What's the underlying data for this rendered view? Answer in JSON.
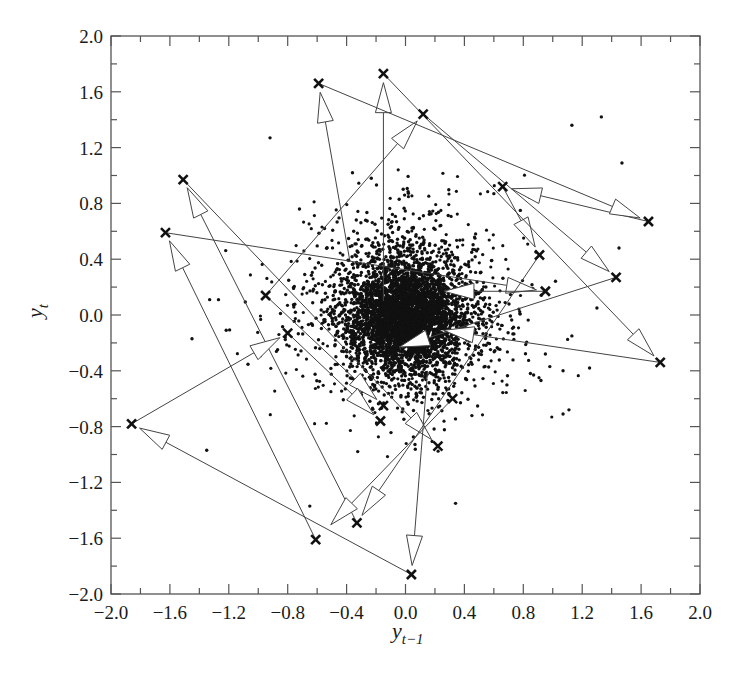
{
  "chart_data": {
    "type": "scatter",
    "title": "",
    "xlabel": "y_{t-1}",
    "ylabel": "y_t",
    "xlabel_parts": {
      "base": "y",
      "sub": "t−1"
    },
    "ylabel_parts": {
      "base": "y",
      "sub": "t"
    },
    "xlim": [
      -2.0,
      2.0
    ],
    "ylim": [
      -2.0,
      2.0
    ],
    "grid": false,
    "legend": null,
    "x_ticks": [
      "−2.0",
      "−1.6",
      "−1.2",
      "−0.8",
      "−0.4",
      "0.0",
      "0.4",
      "0.8",
      "1.2",
      "1.6",
      "2.0"
    ],
    "y_ticks": [
      "2.0",
      "1.6",
      "1.2",
      "0.8",
      "0.4",
      "0.0",
      "−0.4",
      "−0.8",
      "−1.2",
      "−1.6",
      "−2.0"
    ],
    "x_tick_values": [
      -2.0,
      -1.6,
      -1.2,
      -0.8,
      -0.4,
      0.0,
      0.4,
      0.8,
      1.2,
      1.6,
      2.0
    ],
    "y_tick_values": [
      2.0,
      1.6,
      1.2,
      0.8,
      0.4,
      0.0,
      -0.4,
      -0.8,
      -1.2,
      -1.6,
      -2.0
    ],
    "series": [
      {
        "name": "lag scatter (dense cloud)",
        "marker": "dot",
        "description": "~5000 points concentrated around (0,0) with spread roughly ±0.5, sparser outliers out to about ±1.2",
        "center": [
          0.0,
          0.0
        ],
        "core_std": 0.2,
        "outliers": [
          [
            -0.92,
            1.27
          ],
          [
            -0.36,
            1.02
          ],
          [
            -0.72,
            0.76
          ],
          [
            -0.55,
            0.62
          ],
          [
            1.13,
            1.36
          ],
          [
            1.33,
            1.42
          ],
          [
            1.47,
            1.09
          ],
          [
            -1.33,
            0.11
          ],
          [
            -1.27,
            0.11
          ],
          [
            -1.45,
            -0.17
          ],
          [
            -1.35,
            -0.97
          ],
          [
            -0.65,
            -1.37
          ],
          [
            0.34,
            -1.35
          ],
          [
            1.07,
            -0.71
          ],
          [
            1.11,
            -0.68
          ],
          [
            0.87,
            -0.43
          ],
          [
            0.92,
            -0.47
          ],
          [
            0.98,
            -0.37
          ],
          [
            0.95,
            -0.28
          ],
          [
            0.6,
            0.87
          ],
          [
            0.78,
            0.75
          ],
          [
            1.45,
            0.48
          ],
          [
            1.3,
            0.05
          ],
          [
            1.13,
            -0.15
          ],
          [
            1.25,
            -0.38
          ],
          [
            1.07,
            -0.4
          ]
        ]
      },
      {
        "name": "highlighted transitions",
        "marker": "x",
        "points": [
          [
            -0.59,
            1.66
          ],
          [
            -0.15,
            1.73
          ],
          [
            0.12,
            1.44
          ],
          [
            -1.51,
            0.97
          ],
          [
            -1.63,
            0.59
          ],
          [
            0.66,
            0.92
          ],
          [
            1.65,
            0.67
          ],
          [
            0.91,
            0.43
          ],
          [
            1.43,
            0.27
          ],
          [
            0.95,
            0.17
          ],
          [
            -0.95,
            0.14
          ],
          [
            1.73,
            -0.34
          ],
          [
            -0.8,
            -0.13
          ],
          [
            -1.86,
            -0.78
          ],
          [
            -0.15,
            -0.65
          ],
          [
            -0.17,
            -0.76
          ],
          [
            0.32,
            -0.6
          ],
          [
            0.22,
            -0.94
          ],
          [
            -0.33,
            -1.49
          ],
          [
            -0.61,
            -1.61
          ],
          [
            0.04,
            -1.86
          ]
        ]
      }
    ],
    "arrows": [
      {
        "from": [
          -0.38,
          0.4
        ],
        "to": [
          -0.59,
          1.66
        ]
      },
      {
        "from": [
          -0.15,
          0.1
        ],
        "to": [
          -0.15,
          1.73
        ]
      },
      {
        "from": [
          -0.95,
          0.14
        ],
        "to": [
          0.12,
          1.44
        ]
      },
      {
        "from": [
          -0.33,
          -1.49
        ],
        "to": [
          -1.51,
          0.97
        ]
      },
      {
        "from": [
          -0.61,
          -1.61
        ],
        "to": [
          -1.63,
          0.59
        ]
      },
      {
        "from": [
          1.65,
          0.67
        ],
        "to": [
          0.66,
          0.92
        ]
      },
      {
        "from": [
          -0.59,
          1.66
        ],
        "to": [
          1.65,
          0.67
        ]
      },
      {
        "from": [
          0.66,
          0.92
        ],
        "to": [
          0.91,
          0.43
        ]
      },
      {
        "from": [
          0.12,
          1.44
        ],
        "to": [
          1.43,
          0.27
        ]
      },
      {
        "from": [
          -1.63,
          0.59
        ],
        "to": [
          0.95,
          0.17
        ]
      },
      {
        "from": [
          -0.15,
          1.73
        ],
        "to": [
          1.73,
          -0.34
        ]
      },
      {
        "from": [
          -1.86,
          -0.78
        ],
        "to": [
          -0.8,
          -0.13
        ]
      },
      {
        "from": [
          0.04,
          -1.86
        ],
        "to": [
          -1.86,
          -0.78
        ]
      },
      {
        "from": [
          -1.51,
          0.97
        ],
        "to": [
          0.22,
          -0.94
        ]
      },
      {
        "from": [
          -0.95,
          0.14
        ],
        "to": [
          -0.15,
          -0.65
        ]
      },
      {
        "from": [
          -0.8,
          -0.13
        ],
        "to": [
          -0.17,
          -0.76
        ]
      },
      {
        "from": [
          0.15,
          -0.4
        ],
        "to": [
          0.04,
          -1.86
        ]
      },
      {
        "from": [
          0.32,
          -0.6
        ],
        "to": [
          -0.55,
          -1.55
        ]
      },
      {
        "from": [
          0.91,
          0.43
        ],
        "to": [
          -0.33,
          -1.49
        ]
      },
      {
        "from": [
          1.43,
          0.27
        ],
        "to": [
          -0.1,
          -0.25
        ]
      },
      {
        "from": [
          1.73,
          -0.34
        ],
        "to": [
          0.2,
          -0.1
        ]
      },
      {
        "from": [
          0.95,
          0.17
        ],
        "to": [
          0.2,
          0.17
        ]
      }
    ]
  }
}
